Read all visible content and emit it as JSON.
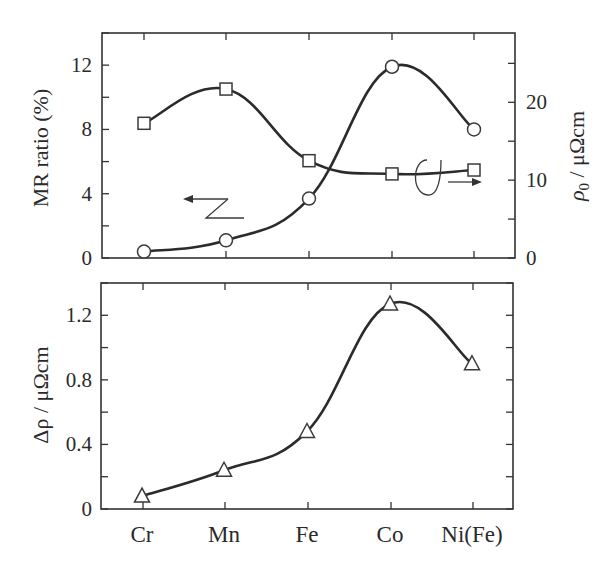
{
  "chart_data": [
    {
      "type": "line",
      "panel": "top",
      "categories": [
        "Cr",
        "Mn",
        "Fe",
        "Co",
        "Ni(Fe)"
      ],
      "ylabel": "MR ratio (%)",
      "ylabel_right": "ρ0 / μΩcm",
      "ylim": [
        0,
        14
      ],
      "yticks": [
        0,
        4,
        8,
        12
      ],
      "ylim_right": [
        0,
        28.9
      ],
      "yticks_right": [
        0,
        10,
        20
      ],
      "grid": false,
      "series": [
        {
          "name": "MR ratio",
          "axis": "left",
          "marker": "circle",
          "values": [
            0.4,
            1.1,
            3.7,
            11.9,
            8.0
          ]
        },
        {
          "name": "ρ0",
          "axis": "right",
          "marker": "square",
          "values": [
            17.3,
            21.7,
            12.5,
            10.8,
            11.3
          ]
        }
      ],
      "annotations": [
        {
          "text": "",
          "kind": "arrow-left",
          "refers_to": "MR ratio (left axis)"
        },
        {
          "text": "",
          "kind": "arrow-right",
          "refers_to": "ρ0 (right axis)"
        }
      ]
    },
    {
      "type": "line",
      "panel": "bottom",
      "categories": [
        "Cr",
        "Mn",
        "Fe",
        "Co",
        "Ni(Fe)"
      ],
      "xlabel": "",
      "ylabel": "Δρ / μΩcm",
      "ylim": [
        0,
        1.4
      ],
      "yticks": [
        0,
        0.4,
        0.8,
        1.2
      ],
      "grid": false,
      "series": [
        {
          "name": "Δρ",
          "axis": "left",
          "marker": "triangle",
          "values": [
            0.08,
            0.24,
            0.48,
            1.27,
            0.9
          ]
        }
      ]
    }
  ],
  "labels": {
    "top_ylabel_left": "MR ratio (%)",
    "top_ylabel_right_symbol": "ρ",
    "top_ylabel_right_sub": "0",
    "top_ylabel_right_unit": " / μΩcm",
    "bottom_ylabel": "Δρ / μΩcm",
    "categories": [
      "Cr",
      "Mn",
      "Fe",
      "Co",
      "Ni(Fe)"
    ],
    "top_left_ticks": [
      "0",
      "4",
      "8",
      "12"
    ],
    "top_right_ticks": [
      "0",
      "10",
      "20"
    ],
    "bottom_ticks": [
      "0",
      "0.4",
      "0.8",
      "1.2"
    ]
  }
}
